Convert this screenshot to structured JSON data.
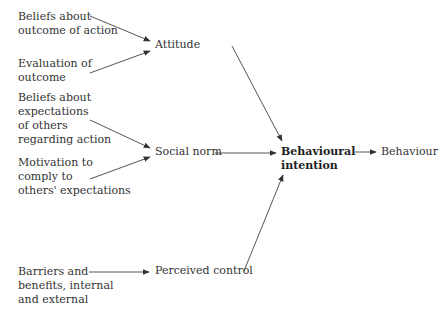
{
  "diagram": {
    "type": "flow",
    "title": "",
    "inputs": {
      "beliefs_outcome": "Beliefs about\noutcome of action",
      "evaluation": "Evaluation of\noutcome",
      "beliefs_expectations": "Beliefs about\nexpectations\nof others\nregarding action",
      "motivation": "Motivation to\ncomply to\nothers' expectations",
      "barriers": "Barriers and\nbenefits, internal\nand external"
    },
    "mediators": {
      "attitude": "Attitude",
      "social_norm": "Social norm",
      "perceived_control": "Perceived control"
    },
    "intention": "Behavioural\nintention",
    "outcome": "Behaviour",
    "edges": [
      {
        "from": "Beliefs about outcome of action",
        "to": "Attitude"
      },
      {
        "from": "Evaluation of outcome",
        "to": "Attitude"
      },
      {
        "from": "Beliefs about expectations of others regarding action",
        "to": "Social norm"
      },
      {
        "from": "Motivation to comply to others' expectations",
        "to": "Social norm"
      },
      {
        "from": "Barriers and benefits, internal and external",
        "to": "Perceived control"
      },
      {
        "from": "Attitude",
        "to": "Behavioural intention"
      },
      {
        "from": "Social norm",
        "to": "Behavioural intention"
      },
      {
        "from": "Perceived control",
        "to": "Behavioural intention"
      },
      {
        "from": "Behavioural intention",
        "to": "Behaviour"
      }
    ],
    "colors": {
      "line": "#444444",
      "text": "#333333",
      "background": "#ffffff"
    }
  }
}
